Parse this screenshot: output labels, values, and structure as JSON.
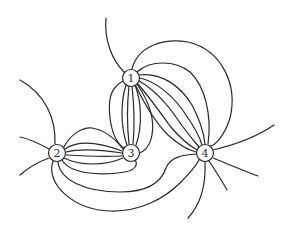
{
  "diagram": {
    "type": "multigraph",
    "nodes": [
      {
        "id": "1",
        "label": "1",
        "x": 131,
        "y": 78
      },
      {
        "id": "2",
        "label": "2",
        "x": 57,
        "y": 153
      },
      {
        "id": "3",
        "label": "3",
        "x": 131,
        "y": 153
      },
      {
        "id": "4",
        "label": "4",
        "x": 205,
        "y": 153
      }
    ],
    "edge_groups": [
      {
        "from": "1",
        "to": "3",
        "count": 6
      },
      {
        "from": "1",
        "to": "4",
        "count": 7
      },
      {
        "from": "2",
        "to": "3",
        "count": 6
      },
      {
        "from": "2",
        "to": "4",
        "count": 2
      },
      {
        "from": "3",
        "to": "4",
        "count": 1
      }
    ],
    "dangling_edges": [
      {
        "from": "1",
        "count": 1
      },
      {
        "from": "2",
        "count": 3
      },
      {
        "from": "4",
        "count": 4
      }
    ],
    "colors": {
      "stroke": "#2a2a2a",
      "background": "#ffffff"
    }
  }
}
